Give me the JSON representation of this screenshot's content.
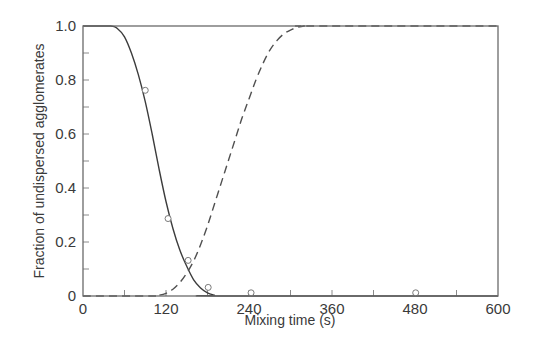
{
  "chart_data": {
    "type": "line",
    "title": "",
    "xlabel": "Mixing time (s)",
    "ylabel": "Fraction of undispersed agglomerates",
    "xlim": [
      0,
      600
    ],
    "ylim": [
      0,
      1.0
    ],
    "x_ticks": [
      0,
      120,
      240,
      360,
      480,
      600
    ],
    "x_tick_labels": [
      "0",
      "120",
      "240",
      "360",
      "480",
      "600"
    ],
    "x_minor_ticks": [
      60,
      180,
      300,
      420,
      540
    ],
    "y_ticks": [
      0,
      0.2,
      0.4,
      0.6,
      0.8,
      1.0
    ],
    "y_tick_labels": [
      "0",
      "0.2",
      "0.4",
      "0.6",
      "0.8",
      "1.0"
    ],
    "y_minor_ticks": [
      0.1,
      0.3,
      0.5,
      0.7,
      0.9
    ],
    "grid": false,
    "legend": null,
    "series": [
      {
        "name": "Undispersed agglomerates (model)",
        "style": "solid",
        "x": [
          0,
          40,
          50,
          60,
          70,
          80,
          90,
          100,
          110,
          120,
          130,
          140,
          150,
          160,
          170,
          180,
          190,
          195,
          600
        ],
        "y": [
          1.0,
          1.0,
          0.99,
          0.96,
          0.9,
          0.82,
          0.72,
          0.6,
          0.47,
          0.35,
          0.25,
          0.17,
          0.11,
          0.06,
          0.03,
          0.012,
          0.003,
          0.0,
          0.0
        ]
      },
      {
        "name": "Dispersed fraction (model)",
        "style": "dashed",
        "x": [
          0,
          100,
          110,
          120,
          130,
          140,
          150,
          160,
          170,
          180,
          190,
          200,
          210,
          220,
          230,
          240,
          250,
          260,
          270,
          280,
          290,
          300,
          310,
          320,
          330,
          600
        ],
        "y": [
          0.0,
          0.0,
          0.003,
          0.01,
          0.025,
          0.05,
          0.085,
          0.13,
          0.19,
          0.26,
          0.34,
          0.42,
          0.5,
          0.58,
          0.66,
          0.73,
          0.8,
          0.86,
          0.91,
          0.945,
          0.97,
          0.985,
          0.995,
          1.0,
          1.0,
          1.0
        ]
      },
      {
        "name": "Experimental data",
        "style": "markers",
        "marker": "open-circle",
        "x": [
          90,
          123,
          152,
          181,
          243,
          481
        ],
        "y": [
          0.76,
          0.285,
          0.13,
          0.03,
          0.01,
          0.01
        ]
      }
    ]
  },
  "labels": {
    "xlabel": "Mixing time (s)",
    "ylabel": "Fraction of undispersed agglomerates"
  }
}
